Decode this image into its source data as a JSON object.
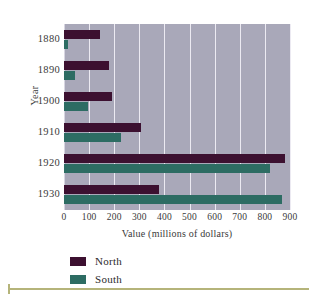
{
  "chart_data": {
    "type": "bar",
    "orientation": "horizontal",
    "title": "",
    "xlabel": "Value (millions of dollars)",
    "ylabel": "Year",
    "categories": [
      "1880",
      "1890",
      "1900",
      "1910",
      "1920",
      "1930"
    ],
    "series": [
      {
        "name": "North",
        "color": "#3c1030",
        "values": [
          145,
          180,
          190,
          305,
          880,
          380
        ]
      },
      {
        "name": "South",
        "color": "#2d6c63",
        "values": [
          15,
          45,
          95,
          225,
          820,
          870
        ]
      }
    ],
    "xlim": [
      0,
      900
    ],
    "xticks": [
      0,
      100,
      200,
      300,
      400,
      500,
      600,
      700,
      800,
      900
    ],
    "xtick_labels": [
      "0",
      "100",
      "200",
      "300",
      "400",
      "500",
      "600",
      "700",
      "800",
      "900"
    ],
    "grid": true,
    "grid_axis": "x",
    "grid_color": "#eceaf2",
    "plot_background": "#a9a8b9",
    "legend_position": "below-left",
    "legend": [
      "North",
      "South"
    ]
  },
  "figure": {
    "background": "#ffffff",
    "accent_rule_color": "#b5b47a"
  }
}
